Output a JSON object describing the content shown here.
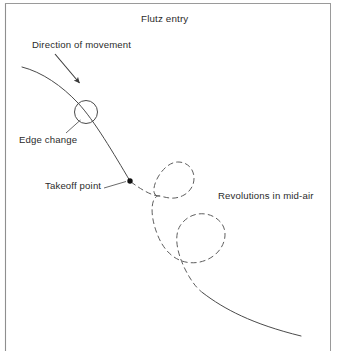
{
  "figure": {
    "title": "Flutz entry",
    "labels": {
      "direction": "Direction of movement",
      "edge_change": "Edge change",
      "takeoff": "Takeoff point",
      "revolutions": "Revolutions in mid-air"
    },
    "colors": {
      "stroke": "#4a4a4a",
      "text": "#2b2b2b",
      "border": "#8a8a8a",
      "background": "#ffffff",
      "marker": "#111111"
    }
  },
  "diagram_data": {
    "type": "diagram",
    "description": "Figure skating flutz entry trajectory: solid entry curve with an edge-change circle, a takeoff point marker, a dashed mid-air path forming two revolution loops, and a solid landing exit curve.",
    "elements": [
      {
        "name": "entry-curve",
        "style": "solid",
        "start": [
          22,
          67
        ],
        "end": [
          130,
          181
        ]
      },
      {
        "name": "edge-change-circle",
        "style": "solid",
        "center": [
          86,
          112
        ],
        "radius": 11.5
      },
      {
        "name": "direction-arrow",
        "style": "solid-arrow",
        "start": [
          55,
          55
        ],
        "end": [
          81,
          85
        ]
      },
      {
        "name": "edge-change-leader",
        "style": "solid",
        "start": [
          67,
          133
        ],
        "end": [
          80,
          120
        ]
      },
      {
        "name": "takeoff-point-marker",
        "style": "filled-dot",
        "center": [
          130,
          181
        ],
        "radius": 2.6
      },
      {
        "name": "takeoff-leader",
        "style": "solid",
        "start": [
          104,
          188
        ],
        "end": [
          126,
          182
        ]
      },
      {
        "name": "mid-air-path",
        "style": "dashed",
        "start": [
          130,
          181
        ],
        "end": [
          203,
          293
        ]
      },
      {
        "name": "revolution-loop-1",
        "style": "dashed",
        "center": [
          178,
          180
        ],
        "radius": 18
      },
      {
        "name": "revolution-loop-2",
        "style": "dashed",
        "center": [
          205,
          243
        ],
        "radius": 22
      },
      {
        "name": "exit-curve",
        "style": "solid",
        "start": [
          203,
          293
        ],
        "end": [
          301,
          336
        ]
      }
    ],
    "frame": {
      "left": 5,
      "top": 3,
      "right": 331,
      "bottom": 351
    }
  }
}
